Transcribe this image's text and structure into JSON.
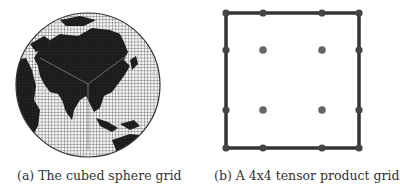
{
  "figure": {
    "panels": [
      {
        "id": "a",
        "caption": "(a) The cubed sphere grid",
        "content": "Globe centered on Asia with a cubed-sphere mesh overlaid"
      },
      {
        "id": "b",
        "caption": "(b) A 4x4 tensor product grid",
        "grid": {
          "size": 4,
          "x": [
            226,
            263,
            322,
            359
          ],
          "y": [
            13,
            50,
            110,
            148
          ],
          "line_color": "#333333",
          "node_color": "#555555"
        }
      }
    ]
  }
}
